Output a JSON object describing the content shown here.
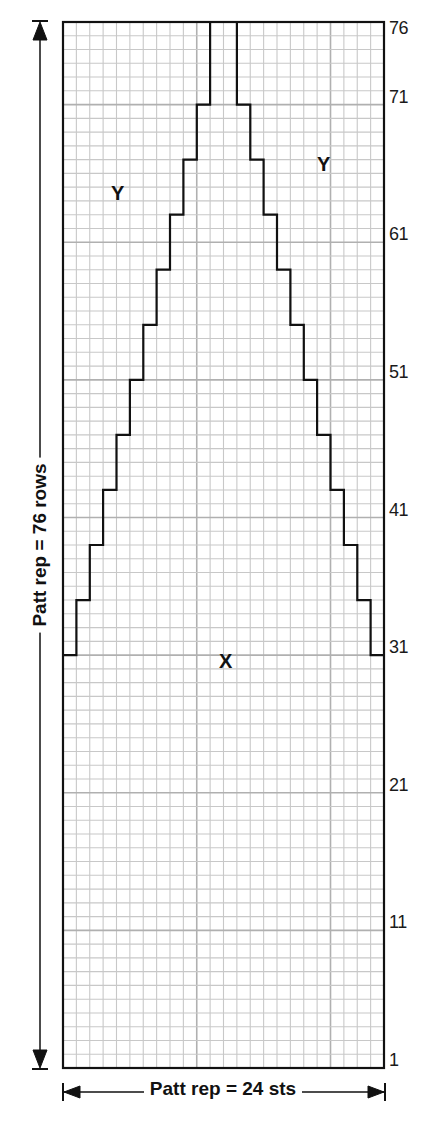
{
  "chart_data": {
    "type": "knitting-chart",
    "title": "",
    "columns": 24,
    "rows": 76,
    "row_labels": [
      "1",
      "11",
      "21",
      "31",
      "41",
      "51",
      "61",
      "71",
      "76"
    ],
    "row_label_values": [
      1,
      11,
      21,
      31,
      41,
      51,
      61,
      71,
      76
    ],
    "width_caption": "Patt rep = 24 sts",
    "height_caption": "Patt rep = 76 rows",
    "regions": [
      {
        "label": "X",
        "description": "Central stepped triangle from row 31 to row 76, background below row 31"
      },
      {
        "label": "Y",
        "description": "Left outer area above row 31"
      },
      {
        "label": "Y",
        "description": "Right outer area above row 31"
      }
    ],
    "triangle_steps": {
      "start_row": 31,
      "rows_per_step": 4,
      "step_rows": [
        31,
        35,
        39,
        43,
        47,
        51,
        55,
        59,
        63,
        67,
        71
      ],
      "inset_per_step_sts": 1,
      "top_width_sts": 2,
      "top_cols": [
        12,
        13
      ]
    }
  },
  "labels": {
    "region_x": "X",
    "region_y_left": "Y",
    "region_y_right": "Y",
    "width_caption": "Patt rep = 24 sts",
    "height_caption": "Patt rep = 76 rows"
  },
  "colors": {
    "grid_line": "#c8c8c8",
    "major_line": "#b0b0b0",
    "outline": "#111111",
    "background": "#ffffff"
  }
}
